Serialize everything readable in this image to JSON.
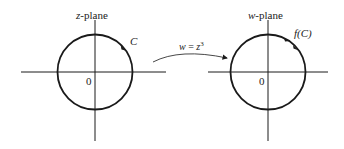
{
  "left_plane": {
    "title_var": "z",
    "title_rest": "-plane",
    "origin_label": "0",
    "curve_label": "C"
  },
  "right_plane": {
    "title_var": "w",
    "title_rest": "-plane",
    "origin_label": "0",
    "curve_label": "f(C)"
  },
  "mapping": {
    "lhs": "w",
    "eq": " = ",
    "rhs_base": "z",
    "rhs_exp": "3"
  },
  "colors": {
    "stroke": "#1a1a1a",
    "text": "#222222"
  }
}
